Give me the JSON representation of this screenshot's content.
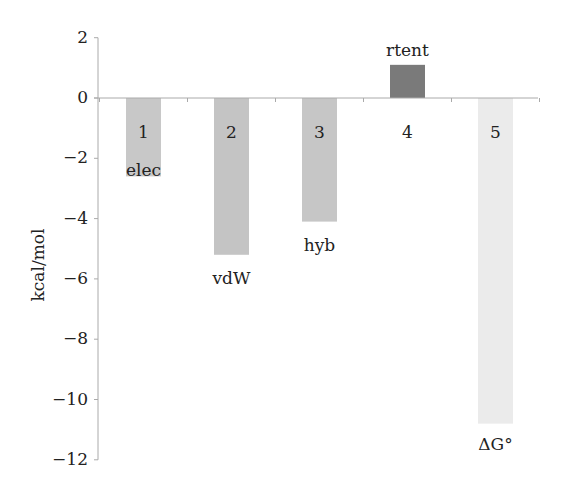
{
  "chart_data": {
    "type": "bar",
    "title": "",
    "xlabel": "",
    "ylabel": "kcal/mol",
    "ylim": [
      -12,
      2
    ],
    "yticks": [
      2,
      0,
      -2,
      -4,
      -6,
      -8,
      -10,
      -12
    ],
    "ytick_labels": [
      "2",
      "0",
      "−2",
      "−4",
      "−6",
      "−8",
      "−10",
      "−12"
    ],
    "grid": false,
    "legend": null,
    "categories": [
      "1",
      "2",
      "3",
      "4",
      "5"
    ],
    "bar_labels": [
      "elec",
      "vdW",
      "hyb",
      "rtent",
      "ΔG°"
    ],
    "values": [
      -2.6,
      -5.2,
      -4.1,
      1.1,
      -10.8
    ],
    "colors": [
      "#c8c8c8",
      "#c4c4c4",
      "#c6c6c6",
      "#7a7a7a",
      "#ebebeb"
    ]
  }
}
